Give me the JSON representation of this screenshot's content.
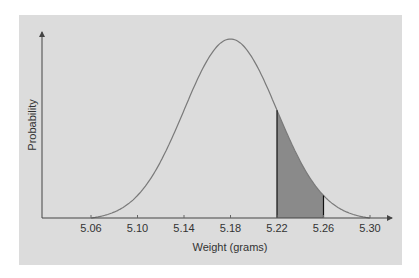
{
  "chart_data": {
    "type": "area",
    "title": "",
    "xlabel": "Weight (grams)",
    "ylabel": "Probability",
    "x_ticks": [
      "5.06",
      "5.10",
      "5.14",
      "5.18",
      "5.22",
      "5.26",
      "5.30"
    ],
    "xlim": [
      5.06,
      5.3
    ],
    "distribution": "normal",
    "mean": 5.18,
    "std_dev": 0.04,
    "shaded_region": {
      "from": 5.22,
      "to": 5.26
    },
    "grid": false,
    "legend": null,
    "colors": {
      "background": "#dcdcdc",
      "curve": "#7a7a7a",
      "shade": "#8a8a8a",
      "axis": "#444444"
    }
  },
  "labels": {
    "xlabel": "Weight (grams)",
    "ylabel": "Probability",
    "ticks": [
      "5.06",
      "5.10",
      "5.14",
      "5.18",
      "5.22",
      "5.26",
      "5.30"
    ]
  }
}
